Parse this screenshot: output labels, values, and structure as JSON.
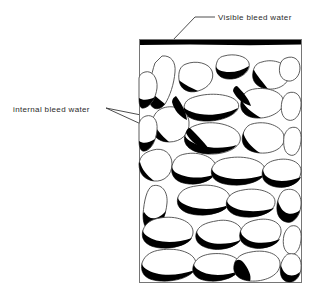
{
  "figure": {
    "type": "diagram",
    "background_color": "#ffffff",
    "ink_color": "#000000",
    "labels": {
      "visible_bleed_water": "Visible bleed water",
      "internal_bleed_water": "internal bleed water"
    },
    "specimen_box": {
      "x": 139,
      "y": 39,
      "width": 163,
      "height": 244,
      "border_color": "#6b6b6b",
      "border_width": 1
    },
    "visible_bleed_layer": {
      "description": "thick black bar across top of specimen",
      "x": 139,
      "y": 39,
      "width": 163,
      "height": 5,
      "color": "#000000"
    },
    "leaders": {
      "visible": {
        "text_anchor_x": 215,
        "text_anchor_y": 17,
        "elbow_x": 195,
        "elbow_y": 17,
        "tip_x": 172,
        "tip_y": 41
      },
      "internal": {
        "text_anchor_x": 106,
        "text_anchor_y": 108,
        "tip_a_x": 156,
        "tip_a_y": 118,
        "tip_b_x": 178,
        "tip_b_y": 141
      }
    },
    "aggregate_particles": {
      "count": 38,
      "outline_color": "#4a4a4a",
      "fill_color": "#ffffff",
      "void_color": "#000000",
      "void_description": "black crescent of internal bleed water trapped under lower face of each aggregate particle"
    }
  }
}
